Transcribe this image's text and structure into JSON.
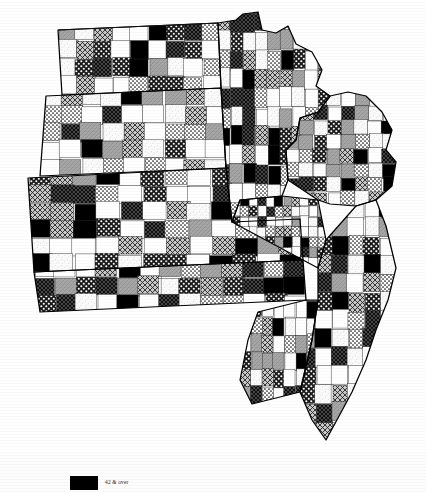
{
  "figure": {
    "kind": "choropleth-map",
    "region_name": "Upper Midwest and Great Plains counties",
    "states_shown": [
      "North Dakota",
      "South Dakota",
      "Nebraska",
      "Kansas",
      "Minnesota",
      "Iowa",
      "Missouri",
      "Wisconsin",
      "Illinois"
    ]
  },
  "legend": {
    "position": "bottom-left",
    "entries": [
      {
        "label": "42 & over",
        "pattern": "solid-black",
        "color": "#000000"
      }
    ]
  },
  "chart_data": {
    "type": "heatmap",
    "title": "",
    "subtitle": "",
    "xlabel": "",
    "ylabel": "",
    "legend_position": "bottom-left",
    "grid": false,
    "map_projection_note": "county outlines, slight clockwise rotation",
    "categories": [
      "white",
      "light-stipple",
      "fine-dot",
      "medium-gray",
      "cross-hatch",
      "coarse-dot",
      "dark-hatch",
      "solid-black"
    ],
    "class_labels": [
      "lowest",
      "low",
      "low-medium",
      "medium",
      "medium-high",
      "high",
      "very high",
      "42 & over"
    ],
    "values": [
      1,
      2,
      3,
      4,
      5,
      6,
      7,
      8
    ],
    "ylim": [
      1,
      8
    ],
    "annotations": [
      "Lake Superior north shore visible at upper right",
      "Green Bay and Door Peninsula visible at right edge",
      "Iowa counties predominantly light / white",
      "Dense black clusters in eastern North Dakota and central Nebraska"
    ]
  }
}
